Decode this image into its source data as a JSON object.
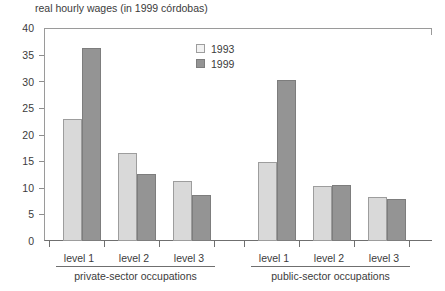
{
  "chart_data": {
    "type": "bar",
    "title": "real hourly wages (in 1999 córdobas)",
    "xlabel": "",
    "ylabel": "",
    "ylim": [
      0,
      40
    ],
    "yticks": [
      0,
      5,
      10,
      15,
      20,
      25,
      30,
      35,
      40
    ],
    "grid": false,
    "legend_position": "top-center",
    "categories": [
      "level 1",
      "level 2",
      "level 3",
      "level 1",
      "level 2",
      "level 3"
    ],
    "groups": [
      {
        "name": "private-sector occupations",
        "categories": [
          "level 1",
          "level 2",
          "level 3"
        ],
        "series": [
          {
            "name": "1993",
            "values": [
              23.0,
              16.5,
              11.3
            ]
          },
          {
            "name": "1999",
            "values": [
              36.2,
              12.5,
              8.7
            ]
          }
        ]
      },
      {
        "name": "public-sector occupations",
        "categories": [
          "level 1",
          "level 2",
          "level 3"
        ],
        "series": [
          {
            "name": "1993",
            "values": [
              14.8,
              10.3,
              8.3
            ]
          },
          {
            "name": "1999",
            "values": [
              30.2,
              10.5,
              7.9
            ]
          }
        ]
      }
    ],
    "series": [
      {
        "name": "1993",
        "color": "#d9d9d9",
        "values": [
          23.0,
          16.5,
          11.3,
          14.8,
          10.3,
          8.3
        ]
      },
      {
        "name": "1999",
        "color": "#949494",
        "values": [
          36.2,
          12.5,
          8.7,
          30.2,
          10.5,
          7.9
        ]
      }
    ]
  },
  "legend": {
    "entries": [
      {
        "label": "1993",
        "color": "#d9d9d9"
      },
      {
        "label": "1999",
        "color": "#949494"
      }
    ]
  },
  "axis": {
    "title": "real hourly wages (in 1999 córdobas)",
    "y_labels": [
      "40",
      "35",
      "30",
      "25",
      "20",
      "15",
      "10",
      "5",
      "0"
    ]
  },
  "group_labels": [
    "level 1",
    "level 2",
    "level 3",
    "level 1",
    "level 2",
    "level 3"
  ],
  "sector_labels": [
    "private-sector occupations",
    "public-sector occupations"
  ],
  "colors": {
    "bar_1993": "#d9d9d9",
    "bar_1999": "#949494",
    "axis": "#6f6f6f",
    "text": "#3b3b3b",
    "background": "#ffffff"
  }
}
